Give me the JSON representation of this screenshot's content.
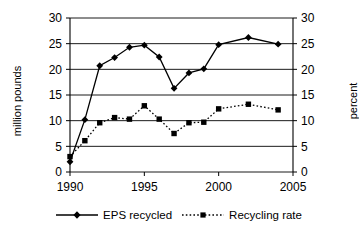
{
  "chart_data": {
    "type": "line",
    "title": "",
    "xlabel": "",
    "ylabel": "million pounds",
    "y2label": "percent",
    "xlim": [
      1990,
      2005
    ],
    "ylim": [
      0,
      30
    ],
    "y2lim": [
      0,
      30
    ],
    "xticks": [
      1990,
      1995,
      2000,
      2005
    ],
    "yticks": [
      0,
      5,
      10,
      15,
      20,
      25,
      30
    ],
    "y2ticks": [
      0,
      5,
      10,
      15,
      20,
      25,
      30
    ],
    "grid": true,
    "legend_position": "bottom",
    "series": [
      {
        "name": "EPS recycled",
        "axis": "left",
        "marker": "diamond",
        "linestyle": "solid",
        "color": "#000000",
        "x": [
          1990,
          1991,
          1992,
          1993,
          1994,
          1995,
          1996,
          1997,
          1998,
          1999,
          2000,
          2002,
          2004
        ],
        "values": [
          2.0,
          10.2,
          20.7,
          22.3,
          24.3,
          24.7,
          22.4,
          16.3,
          19.3,
          20.1,
          24.8,
          26.2,
          24.9
        ]
      },
      {
        "name": "Recycling rate",
        "axis": "right",
        "marker": "square",
        "linestyle": "dotted",
        "color": "#000000",
        "x": [
          1990,
          1991,
          1992,
          1993,
          1994,
          1995,
          1996,
          1997,
          1998,
          1999,
          2000,
          2002,
          2004
        ],
        "values": [
          3.0,
          6.1,
          9.6,
          10.6,
          10.3,
          12.9,
          10.3,
          7.5,
          9.6,
          9.7,
          12.3,
          13.2,
          12.1
        ]
      }
    ]
  },
  "axes": {
    "left_title": "million pounds",
    "right_title": "percent"
  },
  "legend": {
    "items": [
      {
        "label": "EPS recycled",
        "marker": "diamond-marker",
        "line": "solid"
      },
      {
        "label": "Recycling rate",
        "marker": "square-marker",
        "line": "dotted"
      }
    ]
  },
  "tick_labels": {
    "x": [
      "1990",
      "1995",
      "2000",
      "2005"
    ],
    "y_left": [
      "0",
      "5",
      "10",
      "15",
      "20",
      "25",
      "30"
    ],
    "y_right": [
      "0",
      "5",
      "10",
      "15",
      "20",
      "25",
      "30"
    ]
  }
}
